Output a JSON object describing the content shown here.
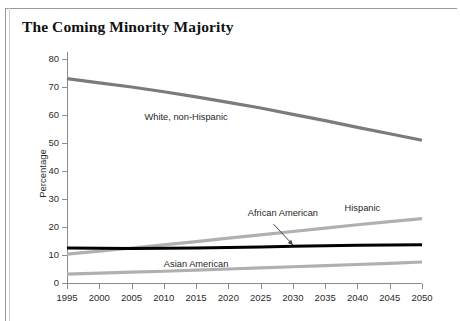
{
  "figure": {
    "title": "The Coming Minority Majority"
  },
  "chart_data": {
    "type": "line",
    "title": "The Coming Minority Majority",
    "xlabel": "",
    "ylabel": "Percentage",
    "xlim": [
      1995,
      2050
    ],
    "ylim": [
      0,
      80
    ],
    "grid": false,
    "legend_position": "inline-labels",
    "x": [
      1995,
      2000,
      2005,
      2010,
      2015,
      2020,
      2025,
      2030,
      2035,
      2040,
      2045,
      2050
    ],
    "xticklabels": [
      "1995",
      "2000",
      "2005",
      "2010",
      "2015",
      "2020",
      "2025",
      "2030",
      "2035",
      "2040",
      "2045",
      "2050"
    ],
    "yticks": [
      0,
      10,
      20,
      30,
      40,
      50,
      60,
      70,
      80
    ],
    "yticklabels": [
      "0",
      "10",
      "20",
      "30",
      "40",
      "50",
      "60",
      "70",
      "80"
    ],
    "series": [
      {
        "name": "White, non-Hispanic",
        "color": "#7b7b7b",
        "width": 3.2,
        "values": [
          73,
          71.5,
          70,
          68.3,
          66.5,
          64.5,
          62.5,
          60.2,
          58,
          55.6,
          53.3,
          51
        ],
        "label_x": 2007,
        "label_y": 59
      },
      {
        "name": "Hispanic",
        "color": "#b0b0b0",
        "width": 3.2,
        "values": [
          10.3,
          11.4,
          12.5,
          13.6,
          14.8,
          16.0,
          17.2,
          18.4,
          19.6,
          20.8,
          21.9,
          23.0
        ],
        "label_x": 2038,
        "label_y": 26.5
      },
      {
        "name": "African American",
        "color": "#000000",
        "width": 3.0,
        "values": [
          12.5,
          12.4,
          12.3,
          12.4,
          12.5,
          12.7,
          12.9,
          13.1,
          13.3,
          13.5,
          13.6,
          13.7
        ],
        "label_x": 2023,
        "label_y": 24.5
      },
      {
        "name": "Asian American",
        "color": "#b0b0b0",
        "width": 3.2,
        "values": [
          3.2,
          3.5,
          3.9,
          4.2,
          4.6,
          5.0,
          5.4,
          5.8,
          6.2,
          6.6,
          7.0,
          7.5
        ],
        "label_x": 2010,
        "label_y": 6.6
      }
    ],
    "annotations": [
      {
        "text": "African American",
        "arrow_from_x": 2027,
        "arrow_from_y": 21,
        "arrow_to_x": 2030,
        "arrow_to_y": 13.6
      }
    ]
  }
}
